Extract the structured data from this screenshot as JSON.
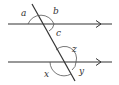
{
  "diagram": {
    "stroke_color": "#333333",
    "labels": {
      "a": "a",
      "b": "b",
      "c": "c",
      "z": "z",
      "x": "x",
      "y": "y"
    }
  }
}
